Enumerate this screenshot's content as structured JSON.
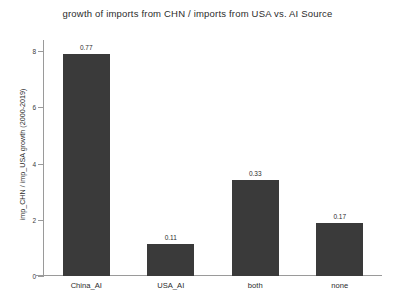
{
  "chart_data": {
    "type": "bar",
    "title": "growth of imports from CHN / imports from USA vs. AI Source",
    "xlabel": "",
    "ylabel": "imp_CHN / imp_USA growth (2000-2019)",
    "categories": [
      "China_AI",
      "USA_AI",
      "both",
      "none"
    ],
    "values": [
      7.9,
      1.15,
      3.4,
      1.9
    ],
    "data_labels": [
      "0.77",
      "0.11",
      "0.33",
      "0.17"
    ],
    "ylim": [
      0,
      8.4
    ],
    "yticks": [
      0,
      2,
      4,
      6,
      8
    ],
    "ytick_labels": [
      "0",
      "2",
      "4",
      "6",
      "8"
    ],
    "grid": false,
    "legend": "none",
    "bar_color": "#3a3a3a",
    "axis_color": "#9a9a9a",
    "background": "#ffffff"
  }
}
